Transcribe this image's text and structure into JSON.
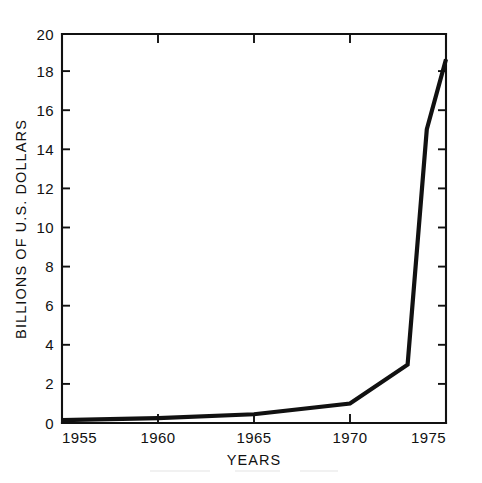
{
  "chart_data": {
    "type": "line",
    "title": "",
    "subtitle": "",
    "xlabel": "YEARS",
    "ylabel": "BILLIONS OF U.S. DOLLARS",
    "xlim": [
      1955,
      1975
    ],
    "ylim": [
      0,
      20
    ],
    "grid": false,
    "legend": null,
    "x_tick_labels": [
      "1955",
      "1960",
      "1965",
      "1970",
      "1975"
    ],
    "x_ticks": [
      1955,
      1960,
      1965,
      1970,
      1975
    ],
    "y_tick_labels": [
      "0",
      "2",
      "4",
      "6",
      "8",
      "10",
      "12",
      "14",
      "16",
      "18",
      "20"
    ],
    "y_ticks": [
      0,
      2,
      4,
      6,
      8,
      10,
      12,
      14,
      16,
      18,
      20
    ],
    "series": [
      {
        "name": "Value",
        "color": "#111111",
        "x": [
          1955,
          1960,
          1965,
          1970,
          1973,
          1974,
          1975
        ],
        "values": [
          0.15,
          0.25,
          0.45,
          1.0,
          3.0,
          15.1,
          18.7
        ]
      }
    ]
  },
  "axes": {
    "y_axis_title": "BILLIONS OF U.S. DOLLARS",
    "x_axis_title": "YEARS",
    "y_max_label": "20",
    "y_min_label": "0",
    "x_min_label": "1955",
    "x_max_label": "1975"
  },
  "style": {
    "line_color": "#111111",
    "axis_color": "#111111",
    "background": "#ffffff"
  }
}
